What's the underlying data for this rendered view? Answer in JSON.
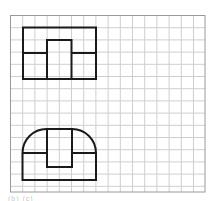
{
  "diagram": {
    "grid": {
      "x0": 10.5,
      "y0": 15.5,
      "x1": 205,
      "y1": 192,
      "cell": 12.2,
      "line_color": "#cfcfcf",
      "border_color": "#9a9a9a"
    },
    "stroke_color": "#1a1a1a",
    "shapes": [
      {
        "name": "top-view-rectangle",
        "outer": {
          "x": 23,
          "y": 27.5,
          "w": 73,
          "h": 51.5
        },
        "divider_y": 53,
        "inner": {
          "x": 47,
          "y": 40,
          "w": 24.5,
          "h": 39
        }
      },
      {
        "name": "front-view-rounded",
        "outer": {
          "x": 22.5,
          "y": 129,
          "w": 73.5,
          "h": 51,
          "radius": 24
        },
        "divider_y": 153,
        "inner": {
          "x": 47,
          "y": 129,
          "w": 25,
          "h": 38
        }
      }
    ],
    "caption": "(b) (c)"
  }
}
